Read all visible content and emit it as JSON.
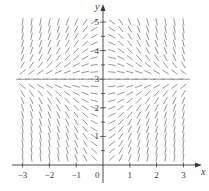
{
  "diagram": {
    "type": "slope-field",
    "equation_form": "dy/dx = x(3 - y)",
    "x_axis_label": "x",
    "y_axis_label": "y",
    "origin_label": "0",
    "x_ticks": [
      {
        "value": -3,
        "label": "−3"
      },
      {
        "value": -2,
        "label": "−2"
      },
      {
        "value": -1,
        "label": "−1"
      },
      {
        "value": 1,
        "label": "1"
      },
      {
        "value": 2,
        "label": "2"
      },
      {
        "value": 3,
        "label": "3"
      }
    ],
    "y_ticks": [
      {
        "value": 1,
        "label": "1"
      },
      {
        "value": 2,
        "label": "2"
      },
      {
        "value": 3,
        "label": "3"
      },
      {
        "value": 4,
        "label": "4"
      },
      {
        "value": 5,
        "label": "5"
      }
    ],
    "x_range": [
      -3,
      3
    ],
    "y_range": [
      0.25,
      5
    ],
    "x_step": 0.3333,
    "y_step": 0.25,
    "equilibrium_line_y": 3,
    "colors": {
      "axis": "#3a3a3a",
      "segment": "#8a8a8a",
      "background": "#ffffff"
    }
  }
}
